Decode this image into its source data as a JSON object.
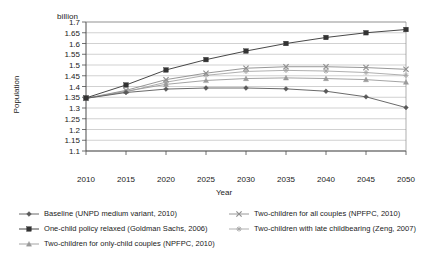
{
  "chart_data": {
    "type": "line",
    "title": "",
    "unit_label": "billion",
    "xlabel": "Year",
    "ylabel": "Population",
    "x": [
      2010,
      2015,
      2020,
      2025,
      2030,
      2035,
      2040,
      2045,
      2050
    ],
    "xtick_labels": [
      "2010",
      "2015",
      "2020",
      "2025",
      "2030",
      "2035",
      "2040",
      "2045",
      "2050"
    ],
    "ytick_labels": [
      "1.7",
      "1.65",
      "1.6",
      "1.55",
      "1.5",
      "1.45",
      "1.4",
      "1.35",
      "1.3",
      "1.25",
      "1.2",
      "1.15",
      "1.1"
    ],
    "ylim": [
      1.1,
      1.7
    ],
    "xlim": [
      2008,
      2052
    ],
    "ytick_step": 0.05,
    "grid": "horizontal",
    "legend_position": "bottom",
    "series": [
      {
        "name": "Baseline (UNPD medium variant, 2010)",
        "marker": "diamond",
        "color": "#595959",
        "values": [
          1.345,
          1.372,
          1.388,
          1.393,
          1.393,
          1.389,
          1.378,
          1.352,
          1.302
        ]
      },
      {
        "name": "One-child policy relaxed (Goldman Sachs, 2006)",
        "marker": "square-filled",
        "color": "#333333",
        "values": [
          1.347,
          1.407,
          1.477,
          1.525,
          1.565,
          1.6,
          1.628,
          1.65,
          1.665
        ]
      },
      {
        "name": "Two-children for only-child couples (NPFPC, 2010)",
        "marker": "triangle",
        "color": "#9a9a9a",
        "values": [
          1.345,
          1.378,
          1.41,
          1.428,
          1.437,
          1.44,
          1.437,
          1.432,
          1.42
        ]
      },
      {
        "name": "Two-children for all couples (NPFPC, 2010)",
        "marker": "cross",
        "color": "#8c8c8c",
        "values": [
          1.345,
          1.382,
          1.432,
          1.462,
          1.485,
          1.492,
          1.492,
          1.488,
          1.48
        ]
      },
      {
        "name": "Two-children with late childbearing (Zeng, 2007)",
        "marker": "asterisk",
        "color": "#a6a6a6",
        "values": [
          1.345,
          1.375,
          1.42,
          1.452,
          1.47,
          1.475,
          1.472,
          1.465,
          1.452
        ]
      }
    ]
  },
  "legend": {
    "left_items": [
      "Baseline (UNPD medium variant, 2010)",
      "One-child policy relaxed (Goldman Sachs, 2006)",
      "Two-children for only-child couples (NPFPC, 2010)"
    ],
    "right_items": [
      "Two-children for all couples (NPFPC, 2010)",
      "Two-children with late childbearing (Zeng, 2007)"
    ]
  }
}
